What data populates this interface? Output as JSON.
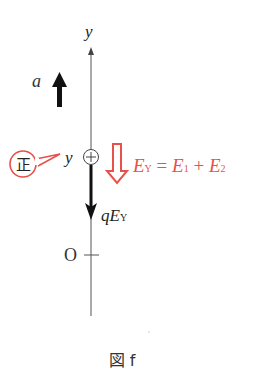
{
  "diagram": {
    "axis_label": "y",
    "acceleration_label": "a",
    "position_label": "y",
    "charge_symbol": "+",
    "positive_badge": "正",
    "field_equation": {
      "lhs": "E",
      "lhs_sub": "Y",
      "eq": " = ",
      "t1": "E",
      "t1_sub": "1",
      "plus": " + ",
      "t2": "E",
      "t2_sub": "2"
    },
    "force_label": {
      "q": "q",
      "E": "E",
      "sub": "Y"
    },
    "origin_label": "O",
    "caption": "図 f"
  },
  "colors": {
    "ink": "#222222",
    "axis": "#555555",
    "accent_red": "#e8504a"
  }
}
